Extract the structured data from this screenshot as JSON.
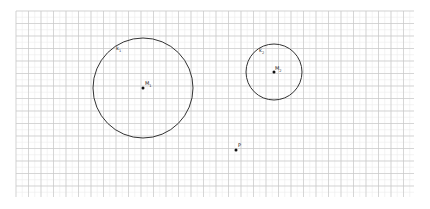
{
  "diagram": {
    "grid": {
      "x0": 16,
      "y0": 11,
      "x1": 414,
      "y1": 197,
      "major_step": 12.5,
      "minor_step": 6.25,
      "major_color": "#c9c9c9",
      "minor_color": "#ececec"
    },
    "circles": [
      {
        "id": "k1",
        "label": "k",
        "sub": "1",
        "cx": 143,
        "cy": 88,
        "r": 50,
        "label_x": 116,
        "label_y": 50,
        "center": {
          "label": "M",
          "sub": "1",
          "label_x": 145,
          "label_y": 85
        }
      },
      {
        "id": "k2",
        "label": "k",
        "sub": "2",
        "cx": 274,
        "cy": 72,
        "r": 28,
        "label_x": 259,
        "label_y": 52,
        "center": {
          "label": "M",
          "sub": "2",
          "label_x": 275,
          "label_y": 70
        }
      }
    ],
    "points": [
      {
        "id": "P",
        "label": "P",
        "x": 236,
        "y": 150,
        "label_x": 238,
        "label_y": 147
      }
    ],
    "stroke_color": "#333333"
  }
}
